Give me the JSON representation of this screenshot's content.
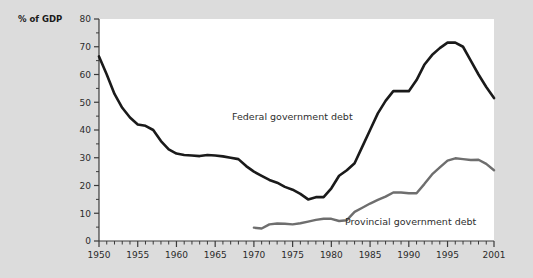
{
  "chart_data": {
    "type": "line",
    "title": "",
    "xlabel": "",
    "ylabel": "% of GDP",
    "xlim": [
      1950,
      2001
    ],
    "ylim": [
      0,
      80
    ],
    "grid": false,
    "legend_position": "inline-annotations",
    "x_major_ticks": [
      1950,
      1955,
      1960,
      1965,
      1970,
      1975,
      1980,
      1985,
      1990,
      1995,
      2001
    ],
    "x_major_tick_labels": [
      "1950",
      "1955",
      "1960",
      "1965",
      "1970",
      "1975",
      "1980",
      "1985",
      "1990",
      "1995",
      "2001"
    ],
    "x_minor_tick_step": 1,
    "y_major_ticks": [
      0,
      10,
      20,
      30,
      40,
      50,
      60,
      70,
      80
    ],
    "y_major_tick_labels": [
      "0",
      "10",
      "20",
      "30",
      "40",
      "50",
      "60",
      "70",
      "80"
    ],
    "y_minor_ticks": [
      5,
      15,
      25,
      35,
      45,
      55,
      65,
      75
    ],
    "series": [
      {
        "name": "Federal government debt",
        "color": "#1a1a1a",
        "width": 2.6,
        "x": [
          1950,
          1951,
          1952,
          1953,
          1954,
          1955,
          1956,
          1957,
          1958,
          1959,
          1960,
          1961,
          1962,
          1963,
          1964,
          1965,
          1966,
          1967,
          1968,
          1969,
          1970,
          1971,
          1972,
          1973,
          1974,
          1975,
          1976,
          1977,
          1978,
          1979,
          1980,
          1981,
          1982,
          1983,
          1984,
          1985,
          1986,
          1987,
          1988,
          1989,
          1990,
          1991,
          1992,
          1993,
          1994,
          1995,
          1996,
          1997,
          1998,
          1999,
          2000,
          2001
        ],
        "values": [
          66.5,
          60.0,
          53.0,
          48.0,
          44.5,
          42.0,
          41.5,
          40.0,
          36.0,
          33.0,
          31.5,
          31.0,
          30.8,
          30.6,
          31.0,
          30.8,
          30.5,
          30.0,
          29.5,
          27.0,
          25.0,
          23.5,
          22.0,
          21.0,
          19.5,
          18.5,
          17.0,
          15.0,
          15.8,
          15.8,
          19.0,
          23.5,
          25.5,
          28.0,
          34.0,
          40.0,
          46.0,
          50.5,
          54.0,
          54.0,
          54.0,
          58.0,
          63.5,
          67.0,
          69.5,
          71.5,
          71.5,
          70.0,
          65.0,
          60.0,
          55.5,
          51.5
        ]
      },
      {
        "name": "Provincial government debt",
        "color": "#6e6e6e",
        "width": 2.4,
        "x": [
          1970,
          1971,
          1972,
          1973,
          1974,
          1975,
          1976,
          1977,
          1978,
          1979,
          1980,
          1981,
          1982,
          1983,
          1984,
          1985,
          1986,
          1987,
          1988,
          1989,
          1990,
          1991,
          1992,
          1993,
          1994,
          1995,
          1996,
          1997,
          1998,
          1999,
          2000,
          2001
        ],
        "values": [
          4.8,
          4.5,
          6.0,
          6.3,
          6.2,
          6.0,
          6.4,
          7.0,
          7.6,
          8.0,
          8.0,
          7.2,
          7.5,
          10.5,
          12.0,
          13.5,
          14.8,
          16.0,
          17.5,
          17.5,
          17.2,
          17.2,
          20.5,
          24.0,
          26.5,
          29.0,
          29.8,
          29.5,
          29.2,
          29.3,
          27.8,
          25.5
        ]
      }
    ],
    "annotations": [
      {
        "text": "Federal government debt",
        "x_px": 232,
        "y_px": 120
      },
      {
        "text": "Provincial government debt",
        "x_px": 345,
        "y_px": 225
      }
    ]
  },
  "axis": {
    "y_axis_title": "% of GDP"
  },
  "colors": {
    "background": "#dcdcdc",
    "plot_background": "#ffffff",
    "axis": "#3a3a3a",
    "federal_line": "#1a1a1a",
    "provincial_line": "#6e6e6e"
  }
}
